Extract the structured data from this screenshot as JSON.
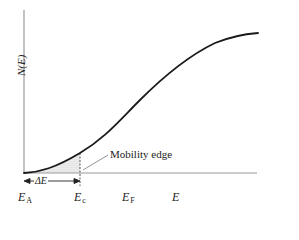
{
  "figure": {
    "type": "density-of-states diagram",
    "y_axis_label": "N(E)",
    "x_axis_label": "E",
    "annotations": {
      "mobility_edge": "Mobility edge",
      "delta_E": "ΔE"
    },
    "energy_markers": [
      {
        "symbol": "E",
        "subscript": "A",
        "x": 24
      },
      {
        "symbol": "E",
        "subscript": "c",
        "x": 80
      },
      {
        "symbol": "E",
        "subscript": "F",
        "x": 128
      },
      {
        "symbol": "E",
        "subscript": "",
        "x": 178
      }
    ],
    "curve": {
      "description": "Density of states rising from band tail at E_A, sigmoid-like, saturating toward upper right",
      "start": [
        24,
        173
      ],
      "end": [
        258,
        33
      ],
      "shaded_region": "localized states between E_A and E_c"
    },
    "colors": {
      "curve": "#1a1a1a",
      "axis": "#9a9a9a",
      "shading": "#bdbdbd",
      "text": "#222222"
    }
  }
}
